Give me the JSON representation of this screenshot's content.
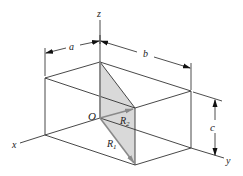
{
  "diagram": {
    "type": "3d-rectangular-box-with-diagonals",
    "axes": {
      "x": "x",
      "y": "y",
      "z": "z"
    },
    "origin_label": "O",
    "dimensions": {
      "a": "a",
      "b": "b",
      "c": "c"
    },
    "vectors": [
      {
        "label_main": "R",
        "label_sub": "1",
        "from": "O",
        "to": "bottom-front-corner"
      },
      {
        "label_main": "R",
        "label_sub": "2",
        "from": "O",
        "to": "top-front-corner"
      }
    ],
    "colors": {
      "line": "#333333",
      "shade": "#d9d9d9",
      "vector": "#8a8a8a"
    }
  }
}
